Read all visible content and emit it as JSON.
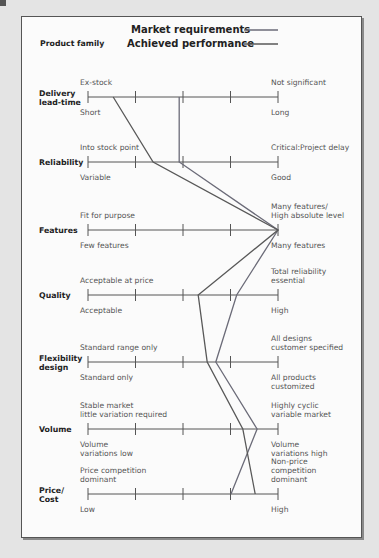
{
  "legend": {
    "title": "Product family",
    "items": [
      {
        "label": "Market requirements",
        "color": "#6b6b78"
      },
      {
        "label": "Achieved performance",
        "color": "#585858"
      }
    ]
  },
  "chart_data": {
    "type": "line",
    "xlabel": "",
    "ylabel": "",
    "scale": {
      "min": 0,
      "max": 4,
      "ticks": [
        0,
        1,
        2,
        3,
        4
      ]
    },
    "categories": [
      "Delivery lead-time",
      "Reliability",
      "Features",
      "Quality",
      "Flexibility design",
      "Volume",
      "Price/Cost"
    ],
    "series": [
      {
        "name": "Market requirements",
        "values": [
          1.92,
          1.92,
          4,
          3.13,
          2.69,
          3.56,
          3.01
        ]
      },
      {
        "name": "Achieved performance",
        "values": [
          0.53,
          1.37,
          4,
          2.32,
          2.51,
          3.26,
          3.52
        ]
      }
    ]
  },
  "dimensions": [
    {
      "label": [
        "Delivery",
        "lead-time"
      ],
      "top_left": [
        "Ex-stock"
      ],
      "top_right": [
        "Not significant"
      ],
      "bottom_left": [
        "Short"
      ],
      "bottom_right": [
        "Long"
      ]
    },
    {
      "label": [
        "Reliability"
      ],
      "top_left": [
        "Into stock point"
      ],
      "top_right": [
        "Critical:Project delay"
      ],
      "bottom_left": [
        "Variable"
      ],
      "bottom_right": [
        "Good"
      ]
    },
    {
      "label": [
        "Features"
      ],
      "top_left": [
        "Fit for purpose"
      ],
      "top_right": [
        "Many features/",
        "High absolute level"
      ],
      "bottom_left": [
        "Few features"
      ],
      "bottom_right": [
        "Many features"
      ]
    },
    {
      "label": [
        "Quality"
      ],
      "top_left": [
        "Acceptable at price"
      ],
      "top_right": [
        "Total reliability",
        "essential"
      ],
      "bottom_left": [
        "Acceptable"
      ],
      "bottom_right": [
        "High"
      ]
    },
    {
      "label": [
        "Flexibility",
        "design"
      ],
      "top_left": [
        "Standard range only"
      ],
      "top_right": [
        "All designs",
        "customer specified"
      ],
      "bottom_left": [
        "Standard only"
      ],
      "bottom_right": [
        "All products",
        "customized"
      ]
    },
    {
      "label": [
        "Volume"
      ],
      "top_left": [
        "Stable market",
        "little variation required"
      ],
      "top_right": [
        "Highly cyclic",
        "variable market"
      ],
      "bottom_left": [
        "Volume",
        "variations low"
      ],
      "bottom_right": [
        "Volume",
        "variations high"
      ]
    },
    {
      "label": [
        "Price/",
        "Cost"
      ],
      "top_left": [
        "Price competition",
        "dominant"
      ],
      "top_right": [
        "Non-price",
        "competition",
        "dominant"
      ],
      "bottom_left": [
        "Low"
      ],
      "bottom_right": [
        "High"
      ]
    }
  ]
}
